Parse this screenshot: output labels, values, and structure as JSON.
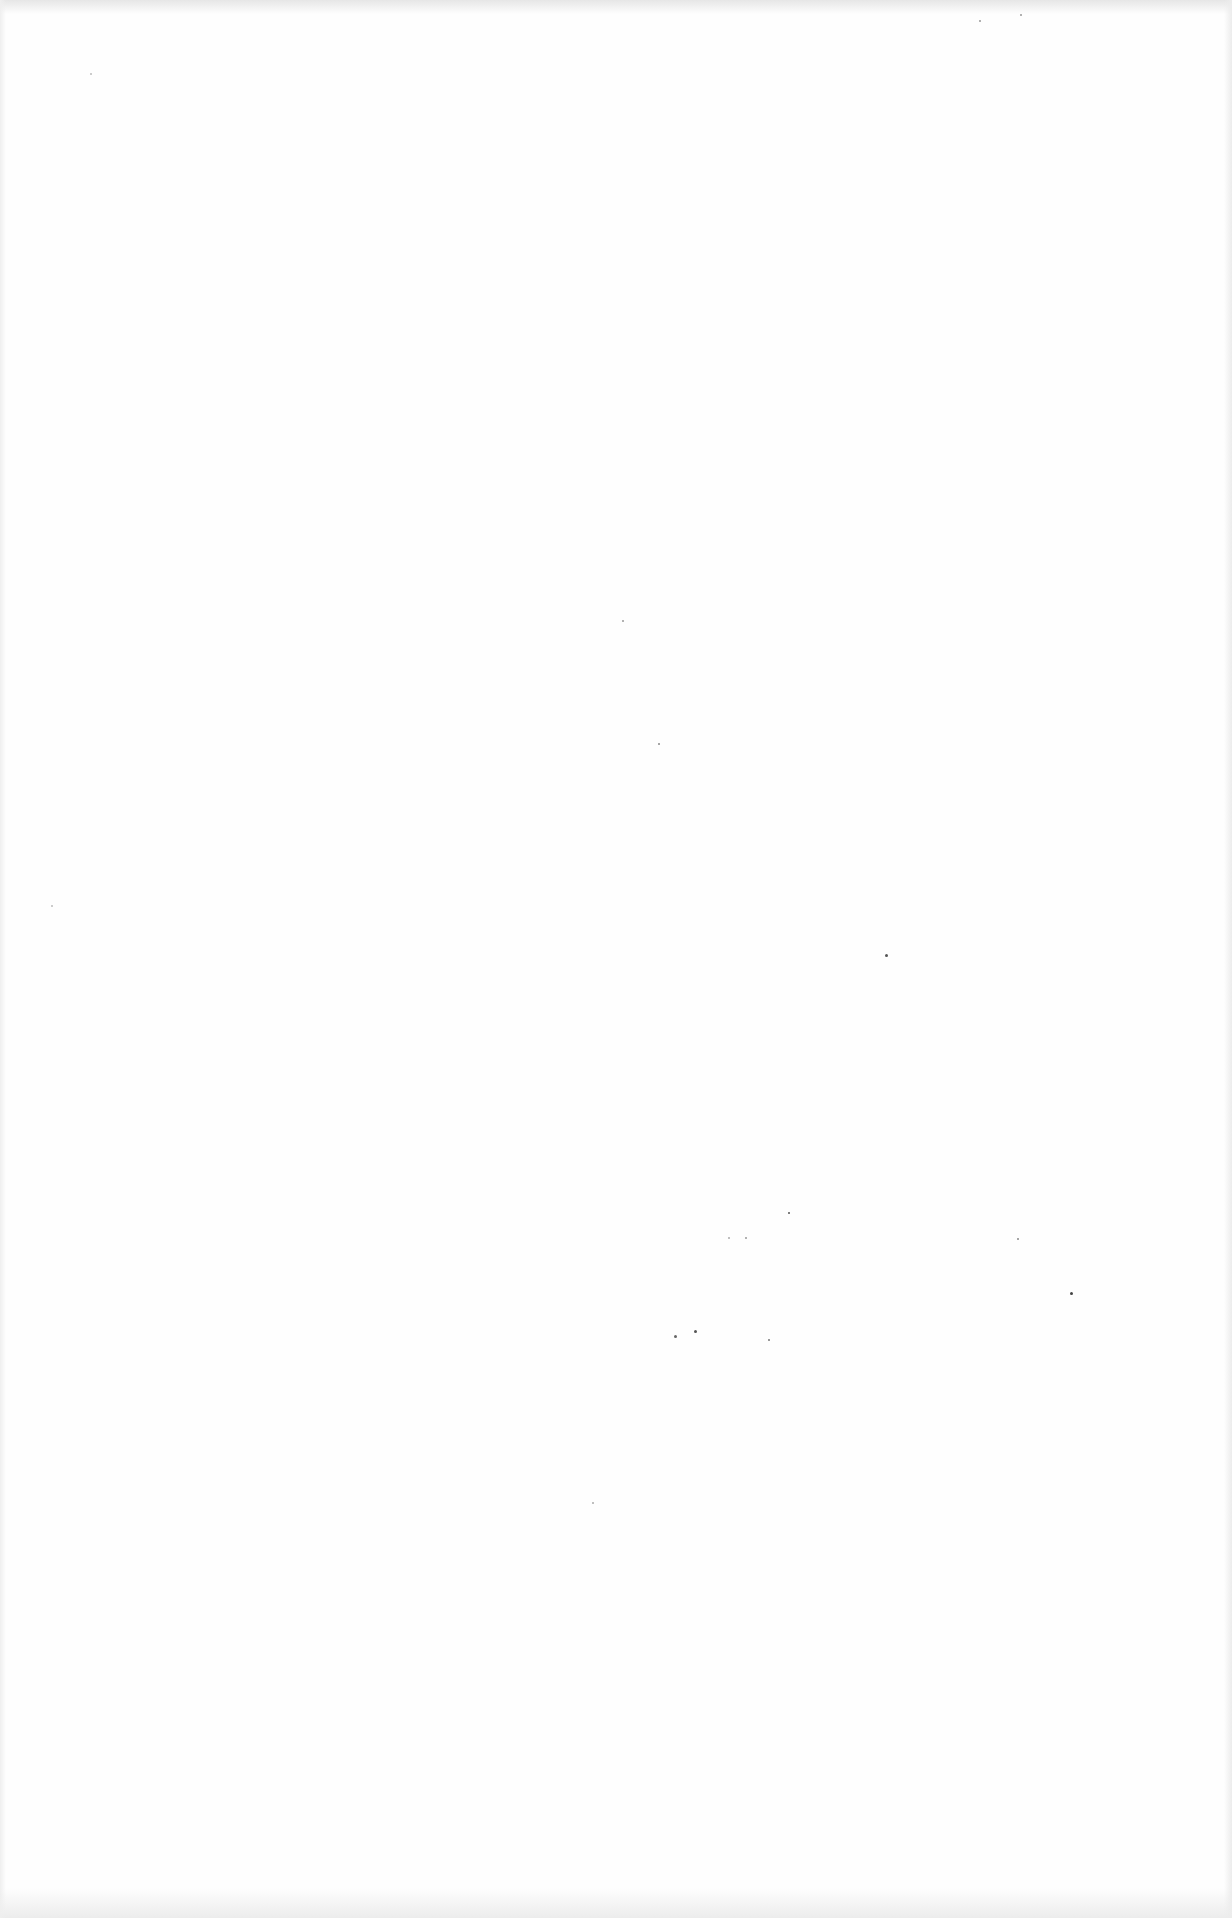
{
  "document": {
    "type": "blank scanned page",
    "background_color": "#fefefe",
    "text": "",
    "specks": [
      {
        "x": 885,
        "y": 954,
        "size": 3,
        "color": "#555555"
      },
      {
        "x": 1070,
        "y": 1292,
        "size": 3,
        "color": "#444444"
      },
      {
        "x": 788,
        "y": 1212,
        "size": 2,
        "color": "#555555"
      },
      {
        "x": 674,
        "y": 1335,
        "size": 3,
        "color": "#666666"
      },
      {
        "x": 694,
        "y": 1330,
        "size": 3,
        "color": "#555555"
      },
      {
        "x": 768,
        "y": 1339,
        "size": 2,
        "color": "#777777"
      },
      {
        "x": 658,
        "y": 743,
        "size": 2,
        "color": "#888888"
      },
      {
        "x": 622,
        "y": 620,
        "size": 2,
        "color": "#999999"
      },
      {
        "x": 745,
        "y": 1237,
        "size": 2,
        "color": "#999999"
      },
      {
        "x": 1017,
        "y": 1238,
        "size": 2,
        "color": "#888888"
      },
      {
        "x": 728,
        "y": 1237,
        "size": 2,
        "color": "#aaaaaa"
      },
      {
        "x": 979,
        "y": 20,
        "size": 2,
        "color": "#999999"
      },
      {
        "x": 1020,
        "y": 14,
        "size": 2,
        "color": "#999999"
      },
      {
        "x": 592,
        "y": 1502,
        "size": 2,
        "color": "#aaaaaa"
      },
      {
        "x": 51,
        "y": 905,
        "size": 2,
        "color": "#bbbbbb"
      },
      {
        "x": 90,
        "y": 73,
        "size": 2,
        "color": "#bbbbbb"
      }
    ]
  }
}
